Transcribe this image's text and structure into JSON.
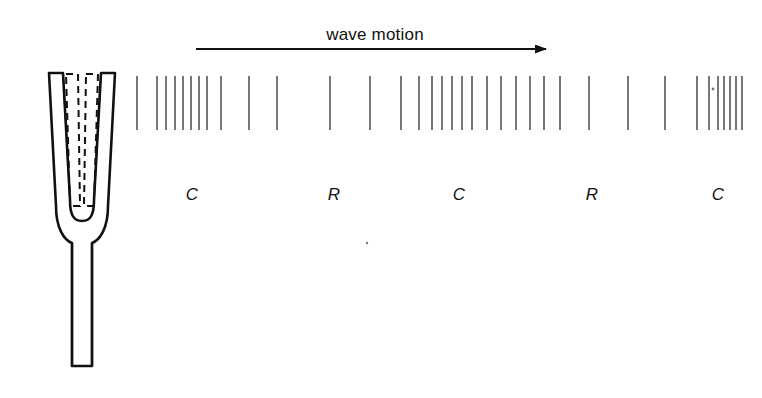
{
  "figure": {
    "type": "physics-diagram",
    "background_color": "#ffffff",
    "ink_color": "#111111",
    "line_color": "#555555",
    "width": 762,
    "height": 398
  },
  "wave_motion": {
    "label": "wave motion",
    "label_x": 375,
    "label_y": 35,
    "arrow": {
      "x1": 196,
      "y1": 49,
      "x2": 560,
      "y2": 49,
      "direction": "right",
      "head_length": 14,
      "head_width": 9
    }
  },
  "tuning_fork": {
    "name": "tuning-fork",
    "outline_color": "#111111",
    "dashed_color": "#111111",
    "prong_top_y": 72,
    "handle_bottom_y": 370,
    "center_x": 82,
    "description": "two tapered prongs with U-bend and straight handle; dashed outlines show the displaced (vibrating) prong positions"
  },
  "wave_lines": {
    "name": "compression-line-band",
    "top_y": 76,
    "bottom_y": 130,
    "stroke_width": 1.6,
    "color": "#555555",
    "count": 36,
    "x_positions": [
      137,
      157,
      166,
      175,
      183,
      191,
      199,
      207,
      221,
      249,
      277,
      330,
      370,
      401,
      419,
      432,
      442,
      452,
      462,
      472,
      487,
      501,
      516,
      530,
      544,
      560,
      589,
      628,
      665,
      697,
      709,
      718,
      724,
      730,
      736,
      742
    ]
  },
  "zone_labels": {
    "name": "compression-rarefaction-labels",
    "y": 185,
    "items": [
      {
        "text": "C",
        "x": 192,
        "meaning": "compression"
      },
      {
        "text": "R",
        "x": 334,
        "meaning": "rarefaction"
      },
      {
        "text": "C",
        "x": 459,
        "meaning": "compression"
      },
      {
        "text": "R",
        "x": 592,
        "meaning": "rarefaction"
      },
      {
        "text": "C",
        "x": 718,
        "meaning": "compression"
      }
    ]
  },
  "stray_marks": [
    {
      "name": "stray-dot",
      "x": 367,
      "y": 243,
      "r": 1.2
    },
    {
      "name": "stray-dot",
      "x": 713,
      "y": 89,
      "r": 1.4
    }
  ]
}
